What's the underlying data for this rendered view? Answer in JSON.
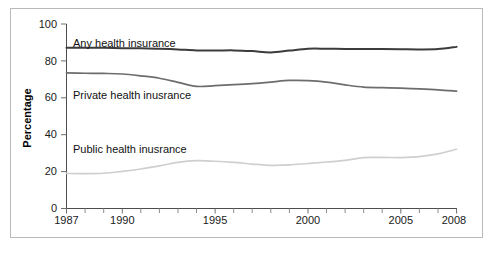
{
  "chart_data": {
    "type": "line",
    "title": "",
    "subtitle": "",
    "xlabel": "",
    "ylabel": "Percentage",
    "xlim": [
      1987,
      2008
    ],
    "ylim": [
      0,
      100
    ],
    "grid": false,
    "legend_position": "inline-labels",
    "x_tick_labels": [
      "1987",
      "1990",
      "1995",
      "2000",
      "2005",
      "2008"
    ],
    "x_tick_values": [
      1987,
      1990,
      1995,
      2000,
      2005,
      2008
    ],
    "x_minor_ticks": [
      1988,
      1989,
      1991,
      1992,
      1993,
      1994,
      1996,
      1997,
      1998,
      1999,
      2001,
      2002,
      2003,
      2004,
      2006,
      2007
    ],
    "y_tick_labels": [
      "0",
      "20",
      "40",
      "60",
      "80",
      "100"
    ],
    "y_tick_values": [
      0,
      20,
      40,
      60,
      80,
      100
    ],
    "x": [
      1987,
      1988,
      1989,
      1990,
      1991,
      1992,
      1993,
      1994,
      1995,
      1996,
      1997,
      1998,
      1999,
      2000,
      2001,
      2002,
      2003,
      2004,
      2005,
      2006,
      2007,
      2008
    ],
    "series": [
      {
        "name": "Any health insurance",
        "label": "Any health insurance",
        "color": "#3c3c3c",
        "width": 2.0,
        "values": [
          87.1,
          87.1,
          87.1,
          86.9,
          86.8,
          86.6,
          86.2,
          85.7,
          85.6,
          85.7,
          85.3,
          84.6,
          85.6,
          86.6,
          86.6,
          86.5,
          86.5,
          86.4,
          86.3,
          86.2,
          86.4,
          87.6
        ]
      },
      {
        "name": "Private health inusrance",
        "label": "Private health inusrance",
        "color": "#6d6d6d",
        "width": 1.7,
        "values": [
          73.5,
          73.3,
          73.2,
          72.9,
          71.9,
          70.6,
          68.4,
          66.2,
          66.6,
          67.1,
          67.7,
          68.5,
          69.4,
          69.3,
          68.5,
          67.0,
          65.8,
          65.5,
          65.2,
          64.8,
          64.3,
          63.6
        ]
      },
      {
        "name": "Public health inusrance",
        "label": "Public health inusrance",
        "color": "#cfcfcf",
        "width": 1.7,
        "values": [
          19.0,
          18.9,
          19.1,
          20.1,
          21.4,
          23.1,
          25.0,
          25.9,
          25.6,
          25.0,
          24.1,
          23.4,
          23.6,
          24.4,
          25.2,
          26.1,
          27.6,
          27.7,
          27.6,
          28.1,
          29.6,
          32.1
        ]
      }
    ]
  },
  "labels": {
    "any_label": "Any health insurance",
    "private_label": "Private health inusrance",
    "public_label": "Public health inusrance",
    "y_axis_title": "Percentage",
    "y0": "0",
    "y20": "20",
    "y40": "40",
    "y60": "60",
    "y80": "80",
    "y100": "100",
    "x1987": "1987",
    "x1990": "1990",
    "x1995": "1995",
    "x2000": "2000",
    "x2005": "2005",
    "x2008": "2008"
  }
}
